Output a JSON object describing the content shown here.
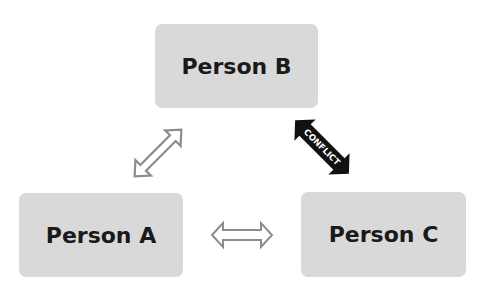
{
  "nodes": {
    "a": {
      "label": "Person A"
    },
    "b": {
      "label": "Person B"
    },
    "c": {
      "label": "Person C"
    }
  },
  "edges": {
    "ab": {
      "style": "outline-double-arrow",
      "color": "#8c8c8c"
    },
    "ac": {
      "style": "outline-double-arrow",
      "color": "#8c8c8c"
    },
    "bc": {
      "style": "solid-double-arrow",
      "color": "#111111",
      "label": "CONFLICT"
    }
  }
}
